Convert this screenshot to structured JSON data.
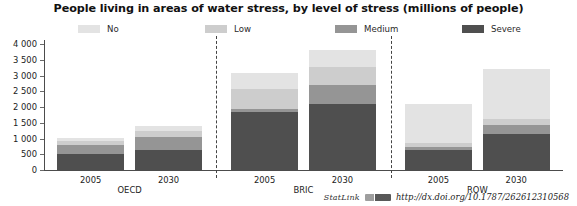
{
  "title": "People living in areas of water stress, by level of stress (millions of people)",
  "legend": {
    "items": [
      {
        "label": "No",
        "color": "#e3e3e3",
        "left": 78
      },
      {
        "label": "Low",
        "color": "#cdcdcd",
        "left": 205
      },
      {
        "label": "Medium",
        "color": "#959595",
        "left": 335
      },
      {
        "label": "Severe",
        "color": "#4f4f4f",
        "left": 462
      }
    ]
  },
  "axis": {
    "y_ticks": [
      "0",
      "500",
      "1 000",
      "1 500",
      "2 000",
      "2 500",
      "3 000",
      "3 500",
      "4 000"
    ],
    "y_min": 0,
    "y_max": 4000,
    "y_step": 500
  },
  "groups": [
    {
      "label": "OECD",
      "center_pct": 16.5
    },
    {
      "label": "BRIC",
      "center_pct": 50.0
    },
    {
      "label": "ROW",
      "center_pct": 83.5
    }
  ],
  "separators": [
    33.2,
    66.8
  ],
  "footer": {
    "statlink_word": "StatLink",
    "statlink_icon": "statlink-glyph-icon",
    "url": "http://dx.doi.org/10.1787/262612310568"
  },
  "chart_data": {
    "type": "bar",
    "subtype": "stacked",
    "title": "People living in areas of water stress, by level of stress (millions of people)",
    "xlabel": "",
    "ylabel": "",
    "ylim": [
      0,
      4000
    ],
    "ytick_step": 500,
    "grid": false,
    "legend_position": "top",
    "categories": [
      "2005",
      "2030",
      "2005",
      "2030",
      "2005",
      "2030"
    ],
    "groups": [
      "OECD",
      "OECD",
      "BRIC",
      "BRIC",
      "ROW",
      "ROW"
    ],
    "series": [
      {
        "name": "Severe",
        "color": "#4f4f4f",
        "values": [
          500,
          640,
          1830,
          2100,
          650,
          1150
        ]
      },
      {
        "name": "Medium",
        "color": "#959595",
        "values": [
          290,
          400,
          120,
          600,
          80,
          280
        ]
      },
      {
        "name": "Low",
        "color": "#cdcdcd",
        "values": [
          130,
          190,
          620,
          560,
          130,
          190
        ]
      },
      {
        "name": "No",
        "color": "#e3e3e3",
        "values": [
          110,
          170,
          510,
          540,
          1240,
          1580
        ]
      }
    ],
    "totals": [
      1030,
      1400,
      3080,
      3800,
      2100,
      3200
    ]
  },
  "bars": [
    {
      "name": "oecd-2005",
      "label": "2005",
      "center_pct": 9.0,
      "width_pct": 13.0
    },
    {
      "name": "oecd-2030",
      "label": "2030",
      "center_pct": 24.0,
      "width_pct": 13.0
    },
    {
      "name": "bric-2005",
      "label": "2005",
      "center_pct": 42.5,
      "width_pct": 13.0
    },
    {
      "name": "bric-2030",
      "label": "2030",
      "center_pct": 57.5,
      "width_pct": 13.0
    },
    {
      "name": "row-2005",
      "label": "2005",
      "center_pct": 76.0,
      "width_pct": 13.0
    },
    {
      "name": "row-2030",
      "label": "2030",
      "center_pct": 91.0,
      "width_pct": 13.0
    }
  ]
}
